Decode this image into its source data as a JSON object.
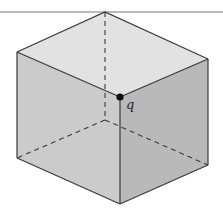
{
  "figure": {
    "type": "cube",
    "point_label": "q",
    "colors": {
      "top_face": "#e2e2e2",
      "left_face": "#cbcbcb",
      "right_face": "#b9b9b9",
      "edge": "#3a3a3a",
      "point": "#111111",
      "rule_line": "#777777"
    }
  }
}
